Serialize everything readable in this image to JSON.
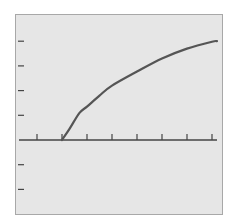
{
  "chart_data": {
    "type": "line",
    "title": "",
    "xlabel": "",
    "ylabel": "",
    "grid": false,
    "legend": null,
    "xlim": [
      0.3,
      8.2
    ],
    "ylim": [
      -3,
      5
    ],
    "x_ticks": [
      1,
      2,
      3,
      4,
      5,
      6,
      7,
      8
    ],
    "y_ticks": [
      -2,
      -1,
      1,
      2,
      3,
      4
    ],
    "tick_labels_shown": false,
    "series": [
      {
        "name": "curve",
        "color": "#555555",
        "x": [
          2,
          2.3,
          2.7,
          3,
          3.5,
          4,
          5,
          6,
          7,
          8,
          8.2
        ],
        "y": [
          0,
          0.45,
          1.1,
          1.35,
          1.8,
          2.2,
          2.77,
          3.3,
          3.7,
          3.98,
          4.0
        ]
      }
    ]
  },
  "style": {
    "plot_background": "#e6e6e6",
    "frame_color": "#a8a8a8",
    "axis_color": "#444444",
    "line_color": "#555555"
  }
}
